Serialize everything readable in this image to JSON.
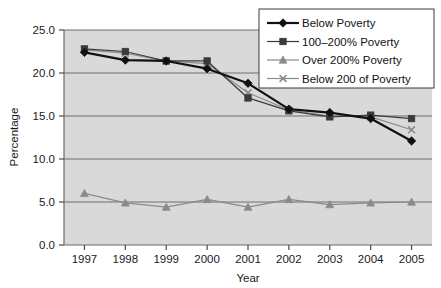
{
  "chart_data": {
    "type": "line",
    "title": "",
    "xlabel": "Year",
    "ylabel": "Percentage",
    "x": [
      1997,
      1998,
      1999,
      2000,
      2001,
      2002,
      2003,
      2004,
      2005
    ],
    "categories": [
      "1997",
      "1998",
      "1999",
      "2000",
      "2001",
      "2002",
      "2003",
      "2004",
      "2005"
    ],
    "xtick_labels": [
      "1997",
      "1998",
      "1999",
      "2000",
      "2001",
      "2002",
      "2003",
      "2004",
      "2005"
    ],
    "ytick_labels": [
      "0.0",
      "5.0",
      "10.0",
      "15.0",
      "20.0",
      "25.0"
    ],
    "ytick_values": [
      0.0,
      5.0,
      10.0,
      15.0,
      20.0,
      25.0
    ],
    "ylim": [
      0.0,
      25.0
    ],
    "grid": "horizontal",
    "legend_position": "top-right",
    "plot_background": "#d9d9d9",
    "figure_background": "#ffffff",
    "series": [
      {
        "name": "Below Poverty",
        "marker": "diamond",
        "color": "#111111",
        "line_width": 2.2,
        "values": [
          22.4,
          21.5,
          21.4,
          20.5,
          18.8,
          15.8,
          15.4,
          14.7,
          12.1
        ]
      },
      {
        "name": "100–200% Poverty",
        "marker": "square",
        "color": "#3a3a3a",
        "line_width": 1.2,
        "values": [
          22.8,
          22.5,
          21.4,
          21.4,
          17.1,
          15.6,
          14.9,
          15.1,
          14.7
        ]
      },
      {
        "name": "Over 200% Poverty",
        "marker": "triangle",
        "color": "#8a8a8a",
        "line_width": 1.2,
        "values": [
          6.0,
          4.9,
          4.4,
          5.3,
          4.4,
          5.3,
          4.7,
          4.9,
          5.0
        ]
      },
      {
        "name": "Below 200 of Poverty",
        "marker": "cross",
        "color": "#8a8a8a",
        "line_width": 1.2,
        "values": [
          22.7,
          22.3,
          21.4,
          21.1,
          17.7,
          15.7,
          15.0,
          14.9,
          13.4
        ]
      }
    ]
  },
  "legend": {
    "items": [
      {
        "label": "Below Poverty",
        "marker": "diamond",
        "color": "#111111"
      },
      {
        "label": "100–200% Poverty",
        "marker": "square",
        "color": "#3a3a3a"
      },
      {
        "label": "Over 200% Poverty",
        "marker": "triangle",
        "color": "#8a8a8a"
      },
      {
        "label": "Below 200 of Poverty",
        "marker": "cross",
        "color": "#8a8a8a"
      }
    ]
  }
}
